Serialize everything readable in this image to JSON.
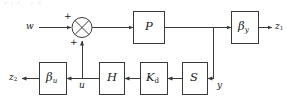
{
  "diagram": {
    "type": "control-block-diagram",
    "title": "",
    "width": 287,
    "height": 102,
    "stroke_color": "#3a3a3a",
    "block_fill": "#ffffff",
    "background": "#ffffff",
    "blocks": [
      {
        "id": "P",
        "label": "P",
        "subscript": "",
        "x": 133,
        "y": 11,
        "w": 31,
        "h": 32
      },
      {
        "id": "beta_y",
        "label": "β",
        "subscript": "y",
        "x": 231,
        "y": 11,
        "w": 27,
        "h": 32
      },
      {
        "id": "beta_u",
        "label": "β",
        "subscript": "u",
        "x": 39,
        "y": 62,
        "w": 27,
        "h": 32
      },
      {
        "id": "H",
        "label": "H",
        "subscript": "",
        "x": 99,
        "y": 62,
        "w": 25,
        "h": 32
      },
      {
        "id": "K_d",
        "label": "K",
        "subscript": "d",
        "x": 140,
        "y": 62,
        "w": 27,
        "h": 32
      },
      {
        "id": "S",
        "label": "S",
        "subscript": "",
        "x": 182,
        "y": 62,
        "w": 25,
        "h": 32
      }
    ],
    "summing_junction": {
      "id": "sum",
      "shape": "crossed-circle",
      "cx": 82,
      "cy": 27,
      "r": 10,
      "signs": [
        {
          "for_input": "w",
          "text": "+",
          "x": 64,
          "y": 12
        },
        {
          "for_input": "u",
          "text": "+",
          "x": 70,
          "y": 38
        }
      ]
    },
    "signals": [
      {
        "id": "w",
        "text": "w",
        "subscript": "",
        "x": 26,
        "y": 22
      },
      {
        "id": "z1",
        "text": "z",
        "subscript": "1",
        "x": 275,
        "y": 22
      },
      {
        "id": "z2",
        "text": "z",
        "subscript": "2",
        "x": 9,
        "y": 73
      },
      {
        "id": "u",
        "text": "u",
        "subscript": "",
        "x": 79,
        "y": 80
      },
      {
        "id": "y",
        "text": "y",
        "subscript": "",
        "x": 217,
        "y": 80
      }
    ],
    "nodes": [
      {
        "id": "node-y",
        "x": 213,
        "y": 78,
        "note": "plant output tap"
      },
      {
        "id": "node-u",
        "x": 82,
        "y": 78,
        "note": "control input tap"
      }
    ],
    "connections": [
      {
        "from": "w",
        "to": "sum",
        "direction": "right"
      },
      {
        "from": "sum",
        "to": "P",
        "direction": "right"
      },
      {
        "from": "P",
        "to": "node-y",
        "direction": "right"
      },
      {
        "from": "node-y",
        "to": "beta_y",
        "direction": "right"
      },
      {
        "from": "beta_y",
        "to": "z1",
        "direction": "right"
      },
      {
        "from": "node-y",
        "to": "y",
        "direction": "down"
      },
      {
        "from": "y",
        "to": "S",
        "direction": "left"
      },
      {
        "from": "S",
        "to": "K_d",
        "direction": "left"
      },
      {
        "from": "K_d",
        "to": "H",
        "direction": "left"
      },
      {
        "from": "H",
        "to": "node-u",
        "direction": "left"
      },
      {
        "from": "node-u",
        "to": "beta_u",
        "direction": "left"
      },
      {
        "from": "beta_u",
        "to": "z2",
        "direction": "left"
      },
      {
        "from": "node-u",
        "to": "sum",
        "direction": "up"
      }
    ]
  }
}
